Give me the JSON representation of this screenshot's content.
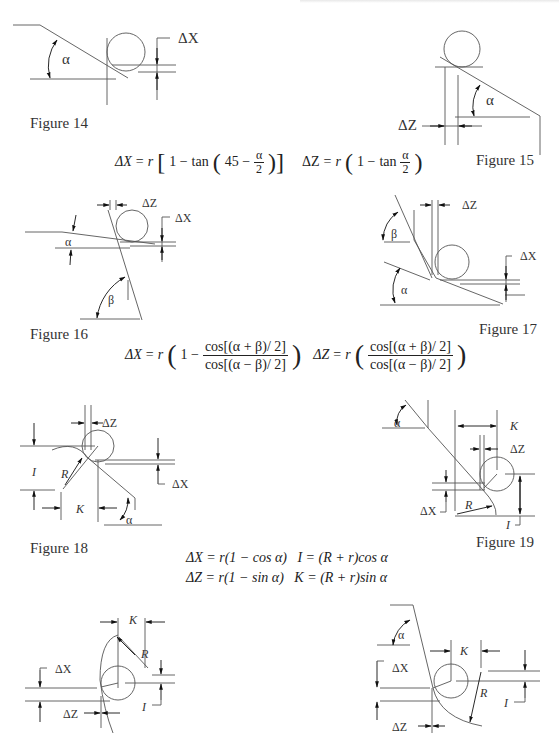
{
  "figures": [
    {
      "id": 14,
      "caption": "Figure 14",
      "labels": {
        "dx": "ΔX",
        "angle": "α"
      }
    },
    {
      "id": 15,
      "caption": "Figure 15",
      "labels": {
        "dz": "ΔZ",
        "angle": "α"
      }
    },
    {
      "id": 16,
      "caption": "Figure 16",
      "labels": {
        "dz": "ΔZ",
        "dx": "ΔX",
        "alpha": "α",
        "beta": "β"
      }
    },
    {
      "id": 17,
      "caption": "Figure 17",
      "labels": {
        "dz": "ΔZ",
        "dx": "ΔX",
        "alpha": "α",
        "beta": "β"
      }
    },
    {
      "id": 18,
      "caption": "Figure 18",
      "labels": {
        "dz": "ΔZ",
        "dx": "ΔX",
        "i": "I",
        "r": "R",
        "k": "K",
        "alpha": "α"
      }
    },
    {
      "id": 19,
      "caption": "Figure 19",
      "labels": {
        "k": "K",
        "dz": "ΔZ",
        "dx": "ΔX",
        "r": "R",
        "i": "I",
        "alpha": "α"
      }
    },
    {
      "id": 20,
      "caption": "",
      "labels": {
        "k": "K",
        "r": "R",
        "dx": "ΔX",
        "i": "I",
        "dz": "ΔZ"
      }
    },
    {
      "id": 21,
      "caption": "",
      "labels": {
        "alpha": "α",
        "k": "K",
        "dx": "ΔX",
        "r": "R",
        "i": "I",
        "dz": "ΔZ"
      }
    }
  ],
  "formulas": {
    "f14_15_dx": "ΔX = r[1 − tan(45 − α/2)]",
    "f14_15_dz": "ΔZ = r(1 − tan α/2)",
    "f16_17_dx": "ΔX = r(1 − cos[(α + β)/2] / cos[(α − β)/2])",
    "f16_17_dz": "ΔZ = r(cos[(α + β)/2] / cos[(α − β)/2])",
    "f18_19_line1": "ΔX = r(1 − cos α)   I = (R + r)cos α",
    "f18_19_line2": "ΔZ = r(1 − sin α)   K = (R + r)sin α"
  },
  "formula_parts": {
    "dx": "ΔX",
    "dz": "ΔZ",
    "eq": "=",
    "r": "r",
    "one_minus": "1 − ",
    "tan": "tan",
    "cos": "cos",
    "forty_five": "45 − ",
    "alpha": "α",
    "two": "2",
    "num": "cos[(α + β)/ 2]",
    "den": "cos[(α − β)/ 2]",
    "line1": "ΔX = r(1 − cos α)",
    "line1b": "I = (R + r)cos α",
    "line2": "ΔZ = r(1 − sin α)",
    "line2b": "K = (R + r)sin α"
  }
}
